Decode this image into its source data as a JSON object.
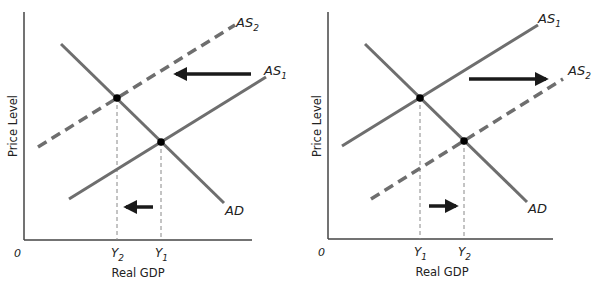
{
  "colors": {
    "curve": "#6e6e6e",
    "axis": "#444444",
    "arrow": "#1a1a1a",
    "point": "#000000",
    "guide": "#888888"
  },
  "panels": [
    {
      "id": "left",
      "origin_label": "0",
      "xlabel": "Real GDP",
      "ylabel": "Price Level",
      "curves": {
        "AD": {
          "label": "AD"
        },
        "AS1": {
          "label": "AS",
          "sub": "1"
        },
        "AS2": {
          "label": "AS",
          "sub": "2"
        }
      },
      "ticks": [
        {
          "label": "Y",
          "sub": "2"
        },
        {
          "label": "Y",
          "sub": "1"
        }
      ],
      "shift_direction": "left"
    },
    {
      "id": "right",
      "origin_label": "0",
      "xlabel": "Real GDP",
      "ylabel": "Price Level",
      "curves": {
        "AD": {
          "label": "AD"
        },
        "AS1": {
          "label": "AS",
          "sub": "1"
        },
        "AS2": {
          "label": "AS",
          "sub": "2"
        }
      },
      "ticks": [
        {
          "label": "Y",
          "sub": "1"
        },
        {
          "label": "Y",
          "sub": "2"
        }
      ],
      "shift_direction": "right"
    }
  ]
}
